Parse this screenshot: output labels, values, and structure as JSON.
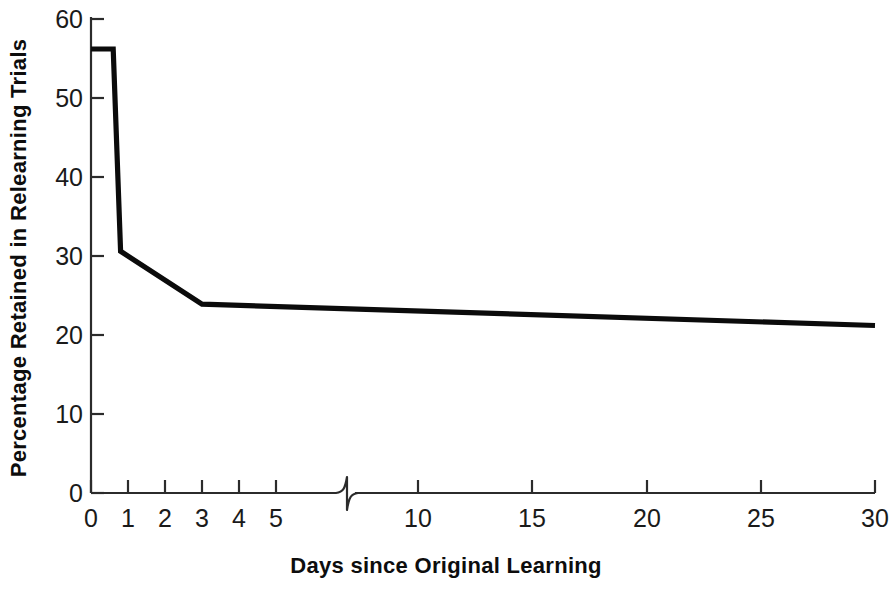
{
  "chart_data": {
    "type": "line",
    "title": "",
    "xlabel": "Days since Original Learning",
    "ylabel": "Percentage Retained in Relearning Trials",
    "xlim": [
      0,
      30
    ],
    "ylim": [
      0,
      60
    ],
    "grid": false,
    "legend": "none",
    "axis_break": {
      "present": true,
      "after_value": 5,
      "before_value": 10,
      "note": "x-axis compressed between 5 and 10 days"
    },
    "xticks": [
      0,
      1,
      2,
      3,
      4,
      5,
      10,
      15,
      20,
      25,
      30
    ],
    "xtick_labels": [
      "0",
      "1",
      "2",
      "3",
      "4",
      "5",
      "10",
      "15",
      "20",
      "25",
      "30"
    ],
    "yticks": [
      0,
      10,
      20,
      30,
      40,
      50,
      60
    ],
    "ytick_labels": [
      "0",
      "10",
      "20",
      "30",
      "40",
      "50",
      "60"
    ],
    "series": [
      {
        "name": "Percentage retained",
        "color": "#0b0b0b",
        "x": [
          0,
          0.6,
          0.8,
          3,
          30
        ],
        "y": [
          56.2,
          56.2,
          30.6,
          23.9,
          21.2
        ],
        "points": [
          {
            "x": 0,
            "y": 56.2
          },
          {
            "x": 0.6,
            "y": 56.2
          },
          {
            "x": 0.8,
            "y": 30.6
          },
          {
            "x": 3,
            "y": 23.9
          },
          {
            "x": 30,
            "y": 21.2
          }
        ]
      }
    ]
  },
  "colors": {
    "line": "#0b0b0b",
    "axis": "#2b2b2b",
    "text": "#1a1a1a",
    "background": "#ffffff"
  }
}
